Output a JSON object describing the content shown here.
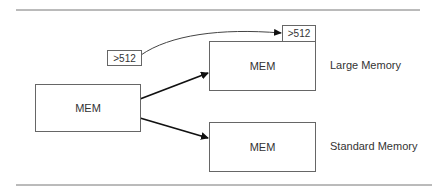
{
  "diagram": {
    "source_box": {
      "label": "MEM"
    },
    "threshold_tag": {
      "label": ">512"
    },
    "large_box": {
      "label": "MEM",
      "tag": ">512",
      "caption": "Large Memory"
    },
    "standard_box": {
      "label": "MEM",
      "caption": "Standard Memory"
    },
    "colors": {
      "line": "#555555",
      "arrow": "#111111",
      "box_border": "#666666"
    }
  }
}
